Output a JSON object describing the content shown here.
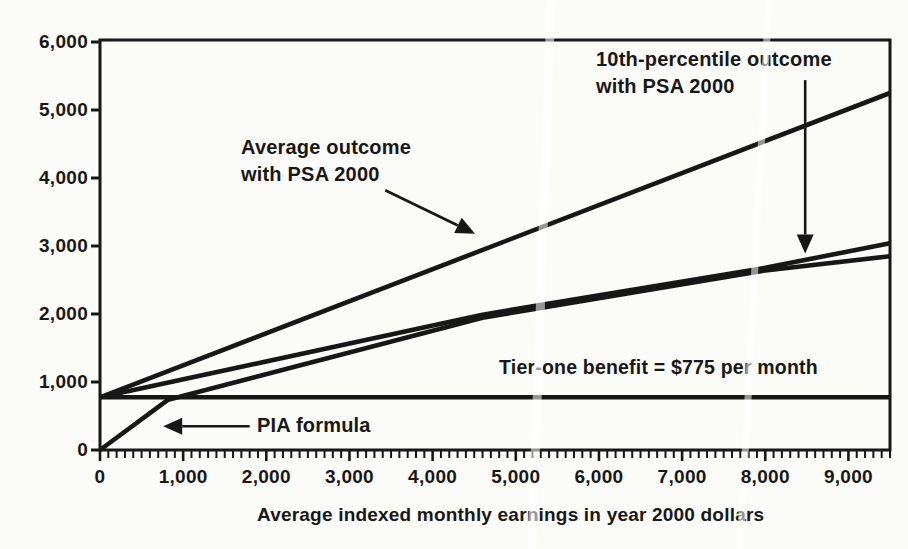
{
  "figure": {
    "ink_color": "#171717",
    "background_color": "#fbfbf8"
  },
  "chart_data": {
    "type": "line",
    "title": "",
    "xlabel": "Average indexed monthly earnings in year 2000 dollars",
    "ylabel": "",
    "xlim": [
      0,
      9500
    ],
    "ylim": [
      0,
      6000
    ],
    "grid": false,
    "legend": "none (direct line annotations with arrows)",
    "x_major_ticks": [
      0,
      1000,
      2000,
      3000,
      4000,
      5000,
      6000,
      7000,
      8000,
      9000
    ],
    "x_tick_labels": [
      "0",
      "1,000",
      "2,000",
      "3,000",
      "4,000",
      "5,000",
      "6,000",
      "7,000",
      "8,000",
      "9,000"
    ],
    "x_minor_tick_interval": 100,
    "y_major_ticks": [
      0,
      1000,
      2000,
      3000,
      4000,
      5000,
      6000
    ],
    "y_tick_labels": [
      "0",
      "1,000",
      "2,000",
      "3,000",
      "4,000",
      "5,000",
      "6,000"
    ],
    "tier_one_benefit_per_month": 775,
    "series": [
      {
        "name": "Average outcome with PSA 2000",
        "points": [
          [
            0,
            775
          ],
          [
            9500,
            5250
          ]
        ]
      },
      {
        "name": "10th-percentile outcome with PSA 2000",
        "points": [
          [
            0,
            775
          ],
          [
            4600,
            1990
          ],
          [
            8000,
            2680
          ],
          [
            9500,
            3040
          ]
        ]
      },
      {
        "name": "PIA formula",
        "points": [
          [
            0,
            0
          ],
          [
            820,
            740
          ],
          [
            4600,
            1945
          ],
          [
            8000,
            2640
          ],
          [
            9500,
            2850
          ]
        ]
      },
      {
        "name": "Tier-one benefit = $775 per month",
        "points": [
          [
            0,
            775
          ],
          [
            9500,
            775
          ]
        ]
      }
    ],
    "annotations": [
      {
        "id": "average-outcome",
        "lines": [
          "Average outcome",
          "with PSA 2000"
        ],
        "arrow": {
          "from": [
            3430,
            3820
          ],
          "to": [
            4510,
            3180
          ]
        }
      },
      {
        "id": "tenth-percentile-outcome",
        "lines": [
          "10th-percentile outcome",
          "with PSA 2000"
        ],
        "arrow": {
          "from": [
            8480,
            5440
          ],
          "to": [
            8480,
            2890
          ]
        }
      },
      {
        "id": "tier-one-benefit",
        "lines": [
          "Tier-one benefit = $775 per month"
        ],
        "arrow": null
      },
      {
        "id": "pia-formula",
        "lines": [
          "PIA formula"
        ],
        "arrow": {
          "from": [
            1800,
            350
          ],
          "to": [
            760,
            350
          ]
        }
      }
    ]
  }
}
